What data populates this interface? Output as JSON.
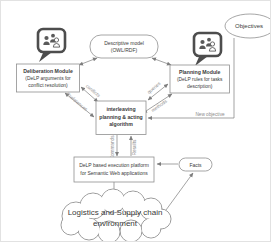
{
  "diagram": {
    "colors": {
      "line": "#7d7d7d",
      "box_border": "#8f8f8f",
      "text": "#3a3a3a",
      "edge_label": "#8a8a8a",
      "icon": "#4d4d4d"
    },
    "objectives": {
      "label": "Objectives"
    },
    "descriptive_model": {
      "line1": "Descriptive model",
      "line2": "(OWL/RDF)"
    },
    "deliberation_module": {
      "title": "Deliberation Module",
      "line1": "(DeLP arguments for",
      "line2": "conflict resolution)"
    },
    "planning_module": {
      "title": "Planning Module",
      "line1": "(DeLP rules for tasks",
      "line2": "description)"
    },
    "interleaving_algorithm": {
      "line1": "interleaving",
      "line2": "planning & acting",
      "line3": "algorithm"
    },
    "execution_platform": {
      "line1": "DeLP based  execution platform",
      "line2": "for Semantic Web applications"
    },
    "facts": {
      "label": "Facts"
    },
    "environment": {
      "line1": "Logistics and Supply chain",
      "line2": "environment"
    },
    "edge_labels": {
      "conflicts": "conflicts",
      "preferences": "Preferences",
      "queries": "queries",
      "methods": "methods",
      "new_objective": "New objective",
      "commands": "Commands",
      "results": "Results"
    }
  }
}
